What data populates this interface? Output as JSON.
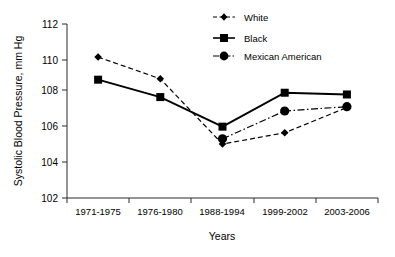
{
  "chart_data": {
    "type": "line",
    "title": "",
    "xlabel": "Years",
    "ylabel": "Systolic Blood Pressure, mm Hg",
    "categories": [
      "1971-1975",
      "1976-1980",
      "1988-1994",
      "1999-2002",
      "2003-2006"
    ],
    "ylim": [
      102,
      112
    ],
    "yticks": [
      102,
      104,
      106,
      108,
      110,
      112
    ],
    "grid": false,
    "legend_position": "top-right",
    "series": [
      {
        "name": "White",
        "marker": "diamond",
        "linestyle": "dashed",
        "color": "#000000",
        "values": [
          110.1,
          108.85,
          105.1,
          105.75,
          107.2
        ]
      },
      {
        "name": "Black",
        "marker": "square",
        "linestyle": "solid",
        "color": "#000000",
        "values": [
          108.8,
          107.8,
          106.1,
          108.05,
          107.95
        ]
      },
      {
        "name": "Mexican American",
        "marker": "circle",
        "linestyle": "dash-dot",
        "color": "#000000",
        "values": [
          null,
          null,
          105.4,
          107.0,
          107.25
        ]
      }
    ]
  },
  "axis": {
    "y_title": "Systolic Blood Pressure, mm Hg",
    "x_title": "Years",
    "y_tick_0": "102",
    "y_tick_1": "104",
    "y_tick_2": "106",
    "y_tick_3": "108",
    "y_tick_4": "110",
    "y_tick_5": "112",
    "x_tick_0": "1971-1975",
    "x_tick_1": "1976-1980",
    "x_tick_2": "1988-1994",
    "x_tick_3": "1999-2002",
    "x_tick_4": "2003-2006"
  },
  "legend": {
    "item_0": "White",
    "item_1": "Black",
    "item_2": "Mexican American"
  }
}
